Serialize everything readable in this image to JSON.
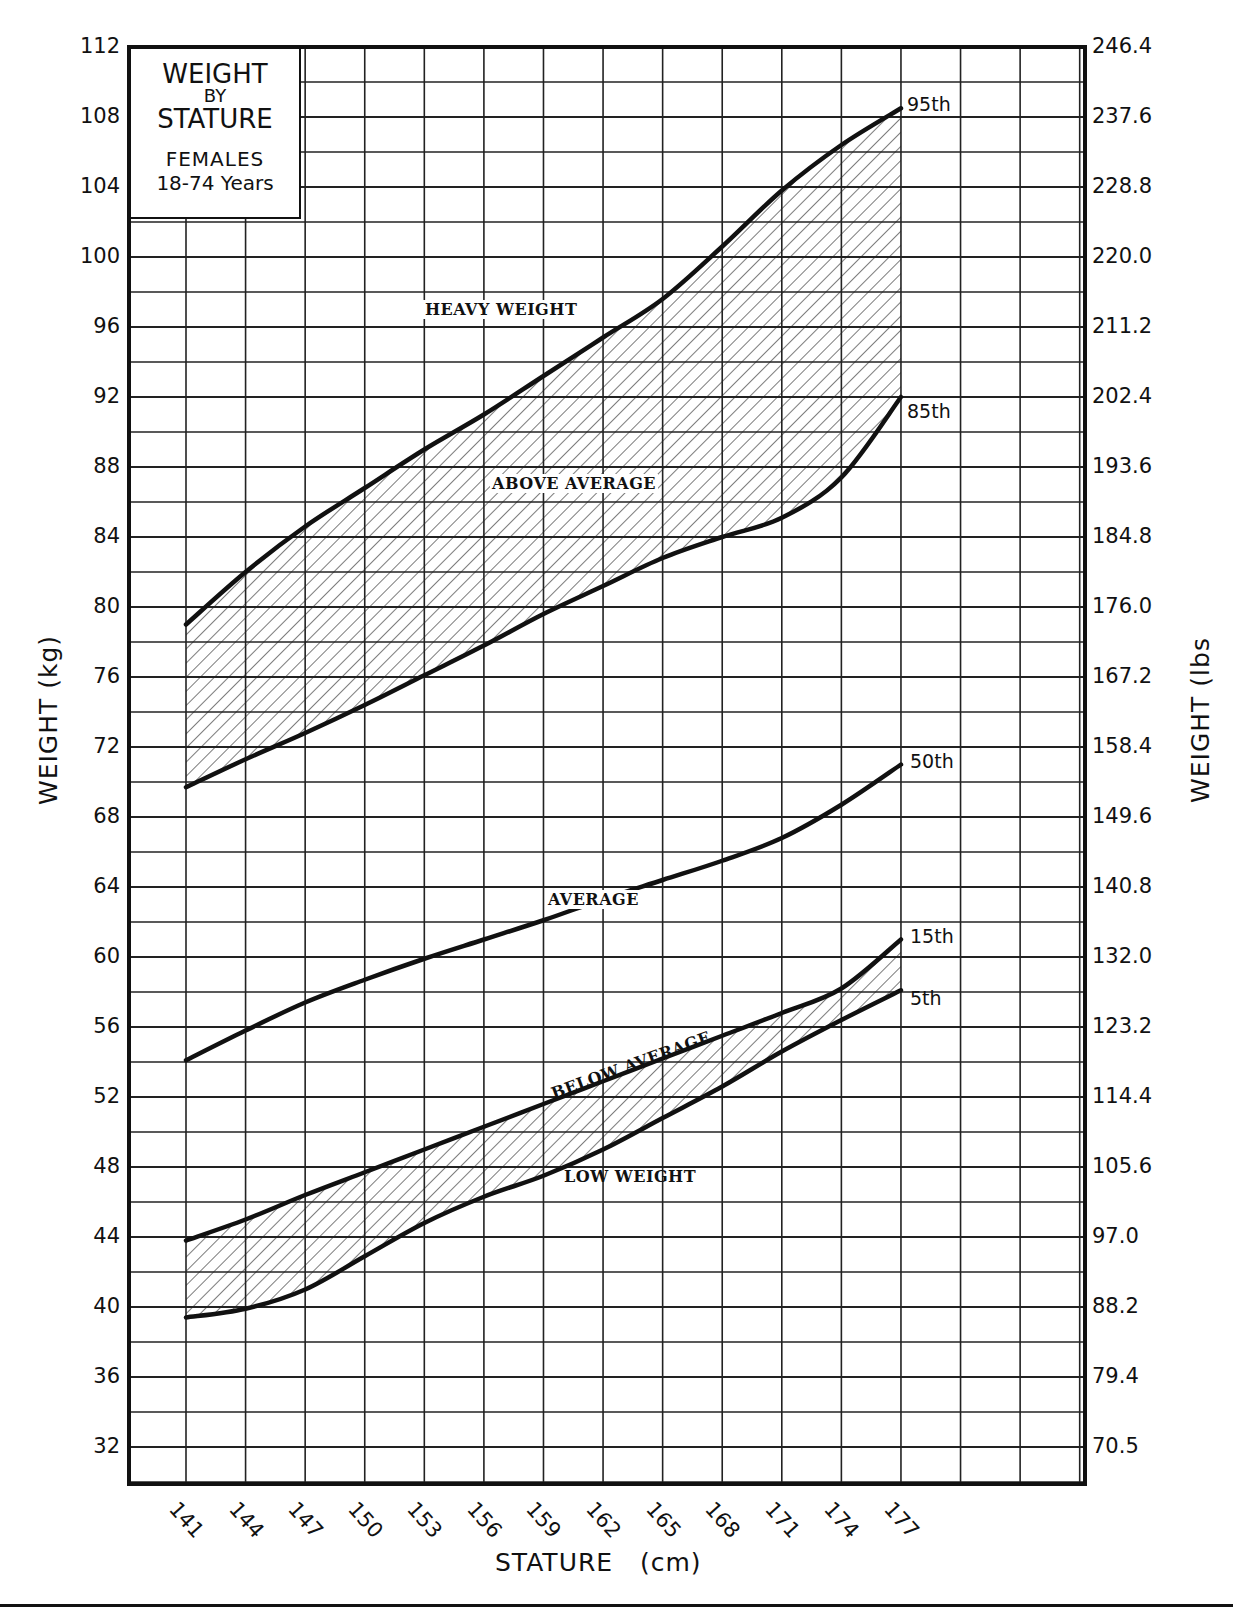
{
  "title_box": {
    "line1": "WEIGHT",
    "line2": "BY",
    "line3": "STATURE",
    "line4": "FEMALES",
    "line5": "18-74 Years"
  },
  "axes": {
    "y_left_title": "WEIGHT (kg)",
    "y_right_title": "WEIGHT (lbs",
    "x_title": "STATURE   (cm)",
    "y_left_ticks": [
      "112",
      "108",
      "104",
      "100",
      "96",
      "92",
      "88",
      "84",
      "80",
      "76",
      "72",
      "68",
      "64",
      "60",
      "56",
      "52",
      "48",
      "44",
      "40",
      "36",
      "32"
    ],
    "y_right_ticks": [
      "246.4",
      "237.6",
      "228.8",
      "220.0",
      "211.2",
      "202.4",
      "193.6",
      "184.8",
      "176.0",
      "167.2",
      "158.4",
      "149.6",
      "140.8",
      "132.0",
      "123.2",
      "114.4",
      "105.6",
      "97.0",
      "88.2",
      "79.4",
      "70.5"
    ],
    "x_ticks": [
      "141",
      "144",
      "147",
      "150",
      "153",
      "156",
      "159",
      "162",
      "165",
      "168",
      "171",
      "174",
      "177"
    ]
  },
  "region_labels": {
    "heavy": "HEAVY WEIGHT",
    "above": "ABOVE AVERAGE",
    "average": "AVERAGE",
    "below": "BELOW AVERAGE",
    "low": "LOW WEIGHT"
  },
  "percentile_labels": {
    "p95": "95th",
    "p85": "85th",
    "p50": "50th",
    "p15": "15th",
    "p5": "5th"
  },
  "colors": {
    "ink": "#111111",
    "background": "#ffffff",
    "grid": "#222222"
  },
  "chart_data": {
    "type": "line",
    "xlabel": "STATURE (cm)",
    "ylabel": "WEIGHT (kg)",
    "ylabel_right": "WEIGHT (lbs)",
    "x": [
      141,
      144,
      147,
      150,
      153,
      156,
      159,
      162,
      165,
      168,
      171,
      174,
      177
    ],
    "ylim": [
      30,
      112
    ],
    "xlim": [
      138,
      186
    ],
    "grid": true,
    "series": [
      {
        "name": "95th",
        "values": [
          79.0,
          82.0,
          84.6,
          86.8,
          89.0,
          91.0,
          93.2,
          95.4,
          97.6,
          100.6,
          103.8,
          106.4,
          108.5
        ]
      },
      {
        "name": "85th",
        "values": [
          69.7,
          71.3,
          72.8,
          74.4,
          76.1,
          77.8,
          79.6,
          81.2,
          82.8,
          84.0,
          85.1,
          87.4,
          92.0
        ]
      },
      {
        "name": "50th",
        "values": [
          54.1,
          55.8,
          57.4,
          58.7,
          59.9,
          61.0,
          62.1,
          63.3,
          64.4,
          65.5,
          66.8,
          68.7,
          71.0
        ]
      },
      {
        "name": "15th",
        "values": [
          43.8,
          45.0,
          46.4,
          47.7,
          49.0,
          50.3,
          51.6,
          52.9,
          54.2,
          55.5,
          56.8,
          58.2,
          61.0
        ]
      },
      {
        "name": "5th",
        "values": [
          39.4,
          39.9,
          41.0,
          42.9,
          44.8,
          46.3,
          47.5,
          49.0,
          50.8,
          52.6,
          54.6,
          56.4,
          58.1
        ]
      }
    ],
    "shaded_bands": [
      {
        "between": [
          "85th",
          "95th"
        ],
        "label": "ABOVE AVERAGE",
        "pattern": "diagonal-hatch"
      },
      {
        "between": [
          "5th",
          "15th"
        ],
        "label": "BELOW AVERAGE",
        "pattern": "diagonal-hatch"
      }
    ],
    "annotations": [
      "HEAVY WEIGHT",
      "ABOVE AVERAGE",
      "AVERAGE",
      "BELOW AVERAGE",
      "LOW WEIGHT"
    ],
    "y_right_ticks_lbs": [
      246.4,
      237.6,
      228.8,
      220.0,
      211.2,
      202.4,
      193.6,
      184.8,
      176.0,
      167.2,
      158.4,
      149.6,
      140.8,
      132.0,
      123.2,
      114.4,
      105.6,
      97.0,
      88.2,
      79.4,
      70.5
    ]
  }
}
